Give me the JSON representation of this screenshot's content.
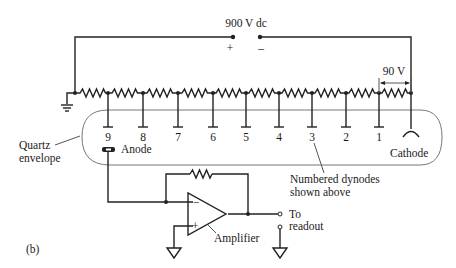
{
  "figure": {
    "label": "(b)",
    "supply": {
      "label": "900 V dc",
      "plus": "+",
      "minus": "–"
    },
    "stage_voltage": "90 V",
    "dynodes": [
      "9",
      "8",
      "7",
      "6",
      "5",
      "4",
      "3",
      "2",
      "1"
    ],
    "envelope_label_line1": "Quartz",
    "envelope_label_line2": "envelope",
    "anode_label": "Anode",
    "cathode_label": "Cathode",
    "dynode_note_line1": "Numbered dynodes",
    "dynode_note_line2": "shown above",
    "amplifier_label": "Amplifier",
    "opamp_minus": "−",
    "opamp_plus": "+",
    "output_line1": "To",
    "output_line2": "readout"
  }
}
